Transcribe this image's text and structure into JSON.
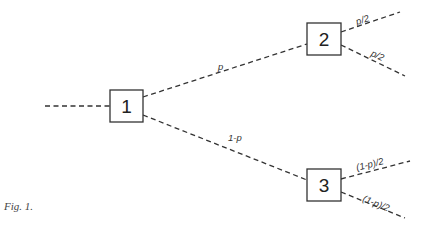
{
  "figure": {
    "caption": "Fig. 1.",
    "nodes": [
      {
        "id": "1",
        "label": "1"
      },
      {
        "id": "2",
        "label": "2"
      },
      {
        "id": "3",
        "label": "3"
      }
    ],
    "edges": [
      {
        "from": "input",
        "to": "1",
        "label": ""
      },
      {
        "from": "1",
        "to": "2",
        "label": "p"
      },
      {
        "from": "1",
        "to": "3",
        "label": "1-p"
      },
      {
        "from": "2",
        "to": "out-2a",
        "label": "p/2"
      },
      {
        "from": "2",
        "to": "out-2b",
        "label": "p/2"
      },
      {
        "from": "3",
        "to": "out-3a",
        "label": "(1-p)/2"
      },
      {
        "from": "3",
        "to": "out-3b",
        "label": "(1-p)/2"
      }
    ]
  }
}
